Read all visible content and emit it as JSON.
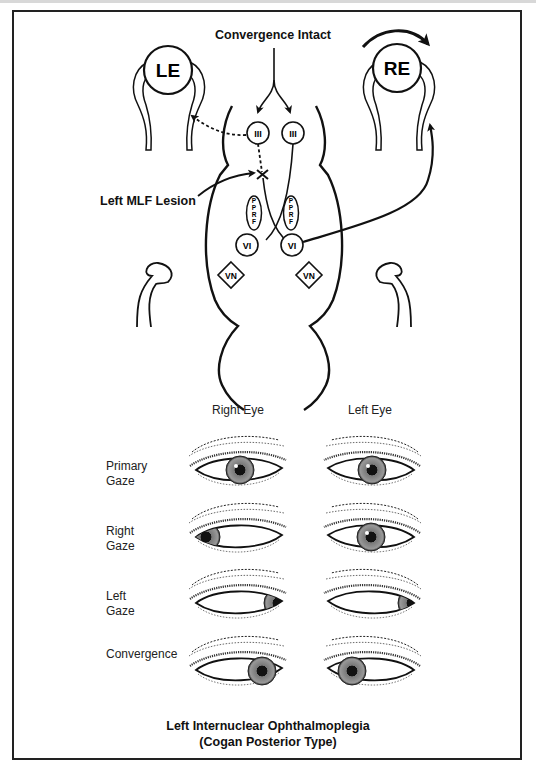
{
  "diagram": {
    "top_label": "Convergence Intact",
    "lesion_label": "Left MLF Lesion",
    "eyes": {
      "left": "LE",
      "right": "RE"
    },
    "nuclei": {
      "oculomotor_left": "III",
      "oculomotor_right": "III",
      "pprf_left": "PPRF",
      "pprf_right": "PPRF",
      "abducens_left": "VI",
      "abducens_right": "VI",
      "vestibular_left": "VN",
      "vestibular_right": "VN"
    },
    "icons": [
      "rotation-arrow-icon",
      "lesion-x-icon",
      "dashed-arrow-icon",
      "solid-arrow-icon"
    ]
  },
  "gaze_chart": {
    "columns": [
      "Right Eye",
      "Left Eye"
    ],
    "rows": [
      {
        "label_line1": "Primary",
        "label_line2": "Gaze",
        "right_eye_iris": "center",
        "left_eye_iris": "center"
      },
      {
        "label_line1": "Right",
        "label_line2": "Gaze",
        "right_eye_iris": "far-left (abducted)",
        "left_eye_iris": "center (fails to adduct)"
      },
      {
        "label_line1": "Left",
        "label_line2": "Gaze",
        "right_eye_iris": "far-right (adducted)",
        "left_eye_iris": "far-right (abducted)"
      },
      {
        "label_line1": "Convergence",
        "label_line2": "",
        "right_eye_iris": "inward",
        "left_eye_iris": "inward"
      }
    ]
  },
  "caption": {
    "line1": "Left Internuclear Ophthalmoplegia",
    "line2": "(Cogan Posterior Type)"
  }
}
